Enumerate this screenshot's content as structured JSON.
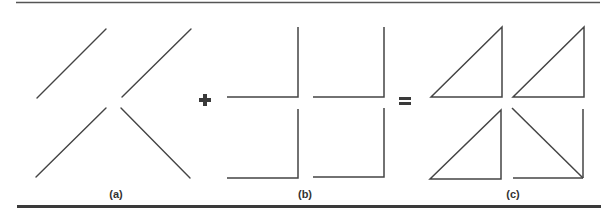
{
  "figure": {
    "line_color": "#444444",
    "rule_color": "#3a3a3a",
    "panels": [
      {
        "id": "a",
        "label": "(a)",
        "description": "four diagonal line segments"
      },
      {
        "id": "b",
        "label": "(b)",
        "description": "four L-shaped right-angle corners"
      },
      {
        "id": "c",
        "label": "(c)",
        "description": "four right triangles formed by combining (a) and (b)"
      }
    ],
    "operators": {
      "plus": "+",
      "equals": "="
    }
  }
}
